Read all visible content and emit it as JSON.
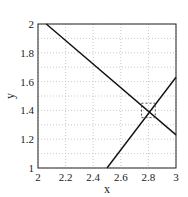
{
  "chart_data": {
    "type": "line",
    "title": "",
    "xlabel": "x",
    "ylabel": "y",
    "xlim": [
      2,
      3
    ],
    "ylim": [
      1,
      2
    ],
    "grid": true,
    "x_ticks": [
      "2",
      "2.2",
      "2.4",
      "2.6",
      "2.8",
      "3"
    ],
    "y_ticks": [
      "1",
      "1.2",
      "1.4",
      "1.6",
      "1.8",
      "2"
    ],
    "series": [
      {
        "name": "line-descending",
        "x": [
          2.06,
          3.0
        ],
        "y": [
          2.0,
          1.23
        ],
        "color": "#111111"
      },
      {
        "name": "line-ascending",
        "x": [
          2.5,
          3.0
        ],
        "y": [
          1.0,
          1.63
        ],
        "color": "#111111"
      }
    ],
    "annotations": [
      {
        "type": "dashed-rectangle",
        "x": [
          2.75,
          2.85
        ],
        "y": [
          1.35,
          1.45
        ],
        "note": "intersection region near (2.8, 1.38)"
      }
    ]
  }
}
